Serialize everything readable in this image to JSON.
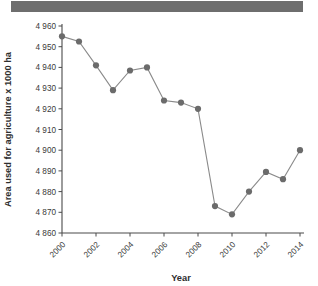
{
  "header": {
    "bar_color": "#6e6e6e"
  },
  "chart_data": {
    "type": "line",
    "title": "",
    "xlabel": "Year",
    "ylabel": "Area used for agriculture x 1000 ha",
    "x": [
      2000,
      2001,
      2002,
      2003,
      2004,
      2005,
      2006,
      2007,
      2008,
      2009,
      2010,
      2011,
      2012,
      2013,
      2014
    ],
    "values": [
      4955,
      4952.5,
      4941,
      4929,
      4938.5,
      4940,
      4924,
      4923,
      4920,
      4873,
      4869,
      4880,
      4889.5,
      4886,
      4900
    ],
    "categories": [
      "2000",
      "2001",
      "2002",
      "2003",
      "2004",
      "2005",
      "2006",
      "2007",
      "2008",
      "2009",
      "2010",
      "2011",
      "2012",
      "2013",
      "2014"
    ],
    "xlim": [
      2000,
      2014
    ],
    "ylim": [
      4860,
      4960
    ],
    "ytick_labels": [
      "4 860",
      "4 870",
      "4 880",
      "4 890",
      "4 900",
      "4 910",
      "4 920",
      "4 930",
      "4 940",
      "4 950",
      "4 960"
    ],
    "ytick_values": [
      4860,
      4870,
      4880,
      4890,
      4900,
      4910,
      4920,
      4930,
      4940,
      4950,
      4960
    ],
    "xtick_labels": [
      "2000",
      "2002",
      "2004",
      "2006",
      "2008",
      "2010",
      "2012",
      "2014"
    ],
    "xtick_values": [
      2000,
      2002,
      2004,
      2006,
      2008,
      2010,
      2012,
      2014
    ],
    "xtick_rotation": 45,
    "grid": false,
    "legend": false,
    "line_color": "#8a8a8a",
    "marker_color": "#6b6b6b",
    "marker_size": 3.1
  },
  "plot_geometry": {
    "left": 62,
    "right": 300,
    "top": 26,
    "bottom": 233
  }
}
